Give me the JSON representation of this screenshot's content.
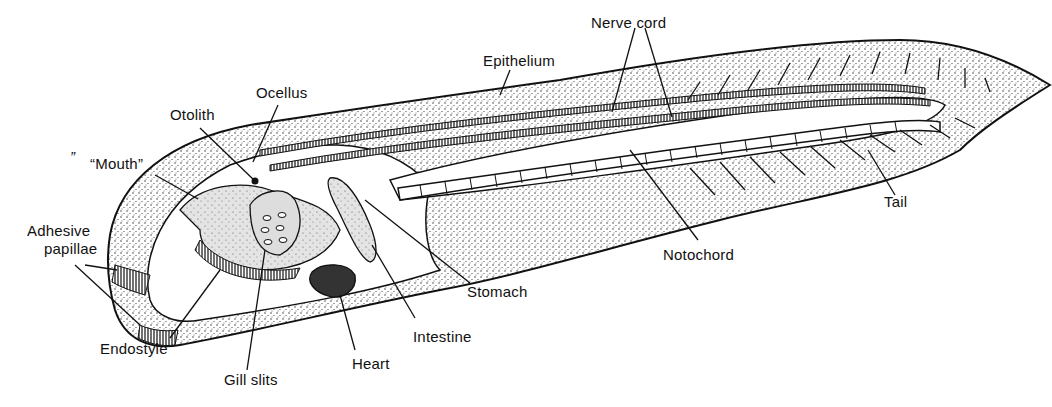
{
  "diagram": {
    "labels": {
      "epithelium": "Epithelium",
      "nerve_cord": "Nerve cord",
      "ocellus": "Ocellus",
      "otolith": "Otolith",
      "mouth": "“Mouth”",
      "adhesive_papillae_1": "Adhesive",
      "adhesive_papillae_2": "papillae",
      "endostyle": "Endostyle",
      "gill_slits": "Gill slits",
      "heart": "Heart",
      "intestine": "Intestine",
      "stomach": "Stomach",
      "notochord": "Notochord",
      "tail": "Tail"
    },
    "stray_mark": "”"
  }
}
